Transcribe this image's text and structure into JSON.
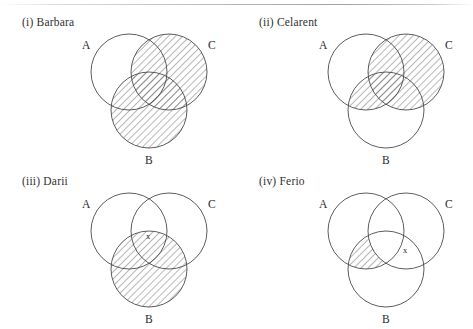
{
  "page": {
    "width": 473,
    "height": 329,
    "background": "#ffffff",
    "ink_color": "#4a4a4a",
    "text_color": "#2b2b2b",
    "hatch_color": "#555555",
    "scanline_present": true
  },
  "figure": {
    "kind": "venn-diagram-set",
    "circle_labels": [
      "A",
      "B",
      "C"
    ],
    "existential_marker": "x"
  },
  "panels": [
    {
      "id": "barbara",
      "title": "(i) Barbara",
      "label_a": "A",
      "label_b": "B",
      "label_c": "C",
      "shaded_regions": [
        "C",
        "B"
      ],
      "shaded_description": "Circle C entirely shaded and circle B entirely shaded; circle A unshaded",
      "marker": null,
      "marker_region": null
    },
    {
      "id": "celarent",
      "title": "(ii) Celarent",
      "label_a": "A",
      "label_b": "B",
      "label_c": "C",
      "shaded_regions": [
        "C"
      ],
      "shaded_description": "Circle C entirely shaded, including its overlap lens with A and with B",
      "marker": null,
      "marker_region": null
    },
    {
      "id": "darii",
      "title": "(iii) Darii",
      "label_a": "A",
      "label_b": "B",
      "label_c": "C",
      "shaded_regions": [
        "B"
      ],
      "shaded_description": "Circle B entirely shaded; an x is placed in the A and C overlap outside B",
      "marker": "x",
      "marker_region": "A-and-C-not-B"
    },
    {
      "id": "ferio",
      "title": "(iv) Ferio",
      "label_a": "A",
      "label_b": "B",
      "label_c": "C",
      "shaded_regions": [
        "A-and-B-not-C"
      ],
      "shaded_description": "The lens where A and B overlap (outside C) is shaded; an x is placed in the B and C overlap",
      "marker": "x",
      "marker_region": "B-and-C"
    }
  ]
}
